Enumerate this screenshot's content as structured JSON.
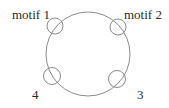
{
  "diagram": {
    "ring": {
      "cx": 88,
      "cy": 54,
      "r": 42,
      "stroke": "#8a8a8a"
    },
    "motifs": [
      {
        "id": "motif-1",
        "label": "motif 1",
        "cx": 55,
        "cy": 26,
        "r": 8,
        "label_x": 12,
        "label_y": 19
      },
      {
        "id": "motif-2",
        "label": "motif 2",
        "cx": 118,
        "cy": 27,
        "r": 8,
        "label_x": 124,
        "label_y": 19
      },
      {
        "id": "motif-3",
        "label": "3",
        "cx": 117,
        "cy": 79,
        "r": 8.5,
        "label_x": 137,
        "label_y": 99
      },
      {
        "id": "motif-4",
        "label": "4",
        "cx": 52,
        "cy": 76,
        "r": 8.5,
        "label_x": 32,
        "label_y": 99
      }
    ],
    "text_color": "#2a2a2a"
  }
}
